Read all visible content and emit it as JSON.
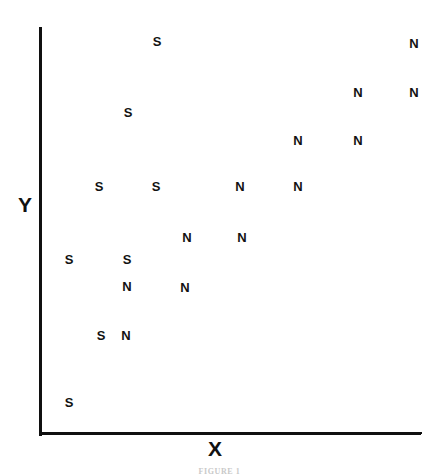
{
  "figure": {
    "caption": "FIGURE 1",
    "background_color": "#ffffff",
    "ink_color": "#111111"
  },
  "axes": {
    "x_title": "X",
    "y_title": "Y"
  },
  "chart_data": {
    "type": "scatter",
    "title": "",
    "xlabel": "X",
    "ylabel": "Y",
    "grid": false,
    "legend": "none",
    "xlim": [
      0,
      439
    ],
    "ylim": [
      0,
      474
    ],
    "axis_tick_labels": {
      "x": [],
      "y": []
    },
    "marker_style": "text-label",
    "series": [
      {
        "name": "S",
        "label": "S",
        "count": 8,
        "points": [
          {
            "label": "S",
            "px": 157,
            "py": 41
          },
          {
            "label": "S",
            "px": 128,
            "py": 112
          },
          {
            "label": "S",
            "px": 99,
            "py": 186
          },
          {
            "label": "S",
            "px": 156,
            "py": 186
          },
          {
            "label": "S",
            "px": 69,
            "py": 259
          },
          {
            "label": "S",
            "px": 127,
            "py": 259
          },
          {
            "label": "S",
            "px": 101,
            "py": 335
          },
          {
            "label": "S",
            "px": 69,
            "py": 402
          }
        ]
      },
      {
        "name": "N",
        "label": "N",
        "count": 12,
        "points": [
          {
            "label": "N",
            "px": 414,
            "py": 43
          },
          {
            "label": "N",
            "px": 358,
            "py": 92
          },
          {
            "label": "N",
            "px": 414,
            "py": 92
          },
          {
            "label": "N",
            "px": 298,
            "py": 140
          },
          {
            "label": "N",
            "px": 358,
            "py": 140
          },
          {
            "label": "N",
            "px": 240,
            "py": 186
          },
          {
            "label": "N",
            "px": 298,
            "py": 186
          },
          {
            "label": "N",
            "px": 187,
            "py": 237
          },
          {
            "label": "N",
            "px": 242,
            "py": 237
          },
          {
            "label": "N",
            "px": 127,
            "py": 286
          },
          {
            "label": "N",
            "px": 185,
            "py": 287
          },
          {
            "label": "N",
            "px": 126,
            "py": 335
          }
        ]
      }
    ]
  }
}
